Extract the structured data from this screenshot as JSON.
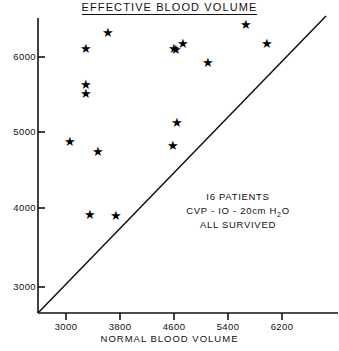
{
  "chart_data": {
    "type": "scatter",
    "title": "EFFECTIVE BLOOD VOLUME",
    "xlabel": "NORMAL BLOOD VOLUME",
    "ylabel": "",
    "xlim": [
      2600,
      6800
    ],
    "ylim": [
      2700,
      6700
    ],
    "xticks": [
      3000,
      3800,
      4600,
      5400,
      6200
    ],
    "yticks": [
      3000,
      4000,
      5000,
      6000
    ],
    "xticklabels": [
      "3000",
      "3800",
      "4600",
      "5400",
      "6200"
    ],
    "yticklabels": [
      "3000",
      "4000",
      "5000",
      "6000"
    ],
    "grid": false,
    "legend": "none",
    "marker": "star",
    "marker_color": "#000000",
    "series": [
      {
        "name": "patients",
        "points": [
          {
            "x": 3300,
            "y": 6140
          },
          {
            "x": 3620,
            "y": 6350
          },
          {
            "x": 4600,
            "y": 6140
          },
          {
            "x": 4630,
            "y": 6130
          },
          {
            "x": 4730,
            "y": 6210
          },
          {
            "x": 5100,
            "y": 5960
          },
          {
            "x": 5670,
            "y": 6450
          },
          {
            "x": 5980,
            "y": 6200
          },
          {
            "x": 3300,
            "y": 5670
          },
          {
            "x": 3300,
            "y": 5540
          },
          {
            "x": 3060,
            "y": 4920
          },
          {
            "x": 3470,
            "y": 4780
          },
          {
            "x": 4650,
            "y": 5170
          },
          {
            "x": 4580,
            "y": 4860
          },
          {
            "x": 3350,
            "y": 3960
          },
          {
            "x": 3740,
            "y": 3940
          }
        ]
      }
    ],
    "reference_line": {
      "label": "identity-line",
      "from": {
        "x": 2600,
        "y": 2700
      },
      "to": {
        "x": 6850,
        "y": 6600
      }
    },
    "annotations": {
      "line1": "I6 PATIENTS",
      "line2_pre": "CVP - IO - 20cm H",
      "line2_sub": "2",
      "line2_post": "O",
      "line3": "ALL SURVIVED"
    }
  }
}
